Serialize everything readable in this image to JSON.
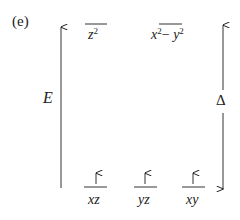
{
  "panel_label": "(e)",
  "axes": {
    "energy_label": "E",
    "splitting_label": "Δ"
  },
  "upper_orbitals": [
    {
      "base": "z",
      "sup": "2"
    },
    {
      "base": "x",
      "sup": "2",
      "mid": "− ",
      "base2": "y",
      "sup2": "2"
    }
  ],
  "lower_orbitals": [
    {
      "label": "xz",
      "electron": "↑"
    },
    {
      "label": "yz",
      "electron": "↑"
    },
    {
      "label": "xy",
      "electron": "↑"
    }
  ],
  "colors": {
    "ink": "#222222",
    "background": "#ffffff"
  }
}
